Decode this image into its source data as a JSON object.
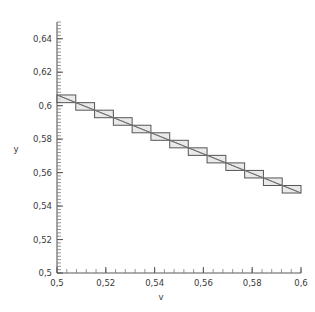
{
  "chart_data": {
    "type": "line",
    "title": "",
    "subtitle": "",
    "xlabel": "v",
    "ylabel": "y",
    "xlim": [
      0.5,
      0.6
    ],
    "ylim": [
      0.5,
      0.65
    ],
    "grid": false,
    "legend": null,
    "x_ticklabels": [
      "0,5",
      "0,52",
      "0,54",
      "0,56",
      "0,58",
      "0,6"
    ],
    "x_tickvalues": [
      0.5,
      0.52,
      0.54,
      0.56,
      0.58,
      0.6
    ],
    "y_ticklabels": [
      "0,5",
      "0,52",
      "0,54",
      "0,56",
      "0,58",
      "0,6",
      "0,62",
      "0,64"
    ],
    "y_tickvalues": [
      0.5,
      0.52,
      0.54,
      0.56,
      0.58,
      0.6,
      0.62,
      0.64
    ],
    "x_minor_step": 0.004,
    "y_minor_step": 0.002,
    "series": [
      {
        "name": "staircase-boxes",
        "type": "step-rectangles",
        "boxes": [
          {
            "x0": 0.5,
            "x1": 0.5077,
            "y0": 0.6018,
            "y1": 0.6064
          },
          {
            "x0": 0.5077,
            "x1": 0.5154,
            "y0": 0.5973,
            "y1": 0.6018
          },
          {
            "x0": 0.5154,
            "x1": 0.5231,
            "y0": 0.5928,
            "y1": 0.5973
          },
          {
            "x0": 0.5231,
            "x1": 0.5308,
            "y0": 0.5883,
            "y1": 0.5928
          },
          {
            "x0": 0.5308,
            "x1": 0.5385,
            "y0": 0.5838,
            "y1": 0.5883
          },
          {
            "x0": 0.5385,
            "x1": 0.5462,
            "y0": 0.5793,
            "y1": 0.5838
          },
          {
            "x0": 0.5462,
            "x1": 0.5538,
            "y0": 0.5748,
            "y1": 0.5793
          },
          {
            "x0": 0.5538,
            "x1": 0.5615,
            "y0": 0.5703,
            "y1": 0.5748
          },
          {
            "x0": 0.5615,
            "x1": 0.5692,
            "y0": 0.5658,
            "y1": 0.5703
          },
          {
            "x0": 0.5692,
            "x1": 0.5769,
            "y0": 0.5613,
            "y1": 0.5658
          },
          {
            "x0": 0.5769,
            "x1": 0.5846,
            "y0": 0.5568,
            "y1": 0.5613
          },
          {
            "x0": 0.5846,
            "x1": 0.5923,
            "y0": 0.5523,
            "y1": 0.5568
          },
          {
            "x0": 0.5923,
            "x1": 0.6,
            "y0": 0.5478,
            "y1": 0.5523
          }
        ]
      },
      {
        "name": "trend-diagonal",
        "type": "line",
        "x": [
          0.5,
          0.6
        ],
        "y": [
          0.6064,
          0.5478
        ]
      }
    ]
  },
  "axes": {
    "x_title": "v",
    "y_title": "y"
  }
}
